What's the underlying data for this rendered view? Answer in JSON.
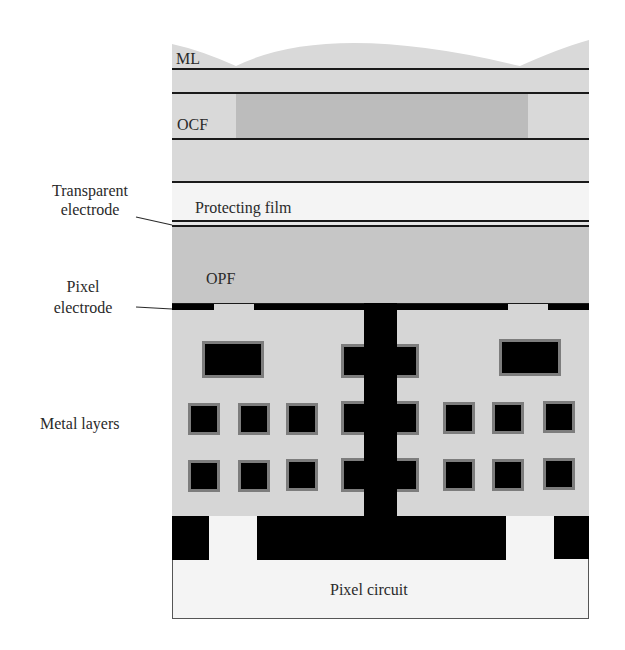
{
  "diagram": {
    "layers": {
      "ml": "ML",
      "ocf": "OCF",
      "protecting_film": "Protecting film",
      "opf": "OPF",
      "pixel_circuit": "Pixel circuit"
    },
    "callouts": {
      "transparent_electrode_line1": "Transparent",
      "transparent_electrode_line2": "electrode",
      "pixel_electrode_line1": "Pixel",
      "pixel_electrode_line2": "electrode",
      "metal_layers": "Metal layers"
    },
    "colors": {
      "light_gray": "#d9d9d9",
      "mid_gray": "#bdbdbd",
      "opf_gray": "#c8c8c8",
      "film_white": "#f4f4f4",
      "metal": "#000000",
      "metal_border": "#7d7d7d"
    }
  }
}
